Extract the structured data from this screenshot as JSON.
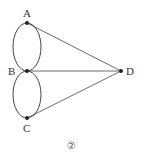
{
  "diagram": {
    "type": "graph",
    "caption": "②",
    "nodes": [
      {
        "id": "A",
        "label": "A"
      },
      {
        "id": "B",
        "label": "B"
      },
      {
        "id": "C",
        "label": "C"
      },
      {
        "id": "D",
        "label": "D"
      }
    ],
    "edges": [
      {
        "from": "A",
        "to": "B",
        "shape": "curve-left"
      },
      {
        "from": "A",
        "to": "B",
        "shape": "curve-right"
      },
      {
        "from": "B",
        "to": "C",
        "shape": "curve-left"
      },
      {
        "from": "B",
        "to": "C",
        "shape": "curve-right"
      },
      {
        "from": "A",
        "to": "D",
        "shape": "line"
      },
      {
        "from": "B",
        "to": "D",
        "shape": "line"
      },
      {
        "from": "C",
        "to": "D",
        "shape": "line"
      }
    ],
    "colors": {
      "stroke": "#444444",
      "node": "#222222"
    }
  }
}
